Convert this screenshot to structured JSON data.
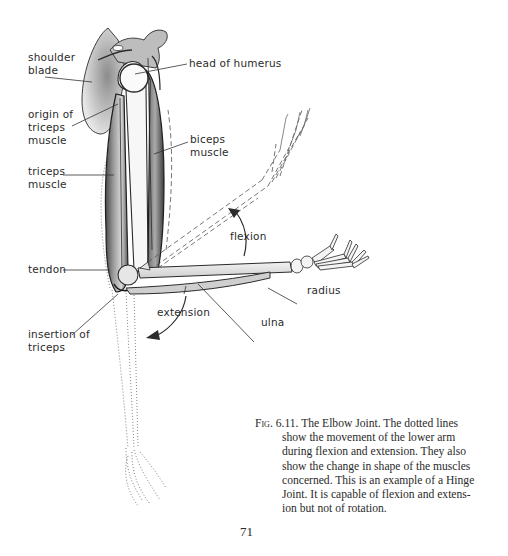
{
  "figure": {
    "title": "The Elbow Joint",
    "labels": {
      "shoulder_blade": "shoulder\nblade",
      "head_of_humerus": "head of humerus",
      "origin_of_triceps": "origin of\ntriceps\nmuscle",
      "biceps_muscle": "biceps\nmuscle",
      "triceps_muscle": "triceps\nmuscle",
      "flexion": "flexion",
      "tendon": "tendon",
      "radius": "radius",
      "extension": "extension",
      "ulna": "ulna",
      "insertion_of_triceps": "insertion of\ntriceps"
    }
  },
  "caption": {
    "fig_id": "Fig. 6.11.",
    "lines": [
      " The Elbow Joint. The dotted lines",
      "show the movement of the lower arm",
      "during flexion and extension. They also",
      "show the change in shape of the muscles",
      "concerned. This is an example of a Hinge",
      "Joint. It is capable of flexion and extens-",
      "ion but not of rotation."
    ]
  },
  "page_number": "71",
  "colors": {
    "ink": "#2b2b2b",
    "bone": "#e8e8e8",
    "muscle_shade": "#8a8a8a",
    "background": "#ffffff"
  }
}
